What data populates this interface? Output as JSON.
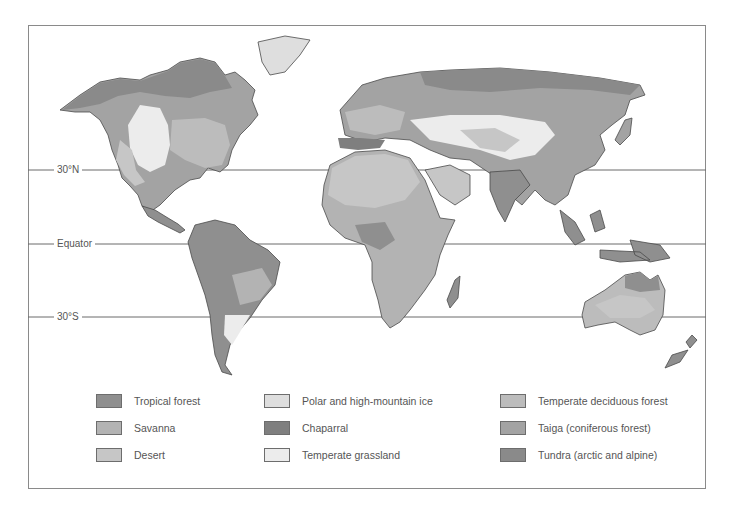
{
  "map": {
    "title": "World biomes",
    "latitude_lines": [
      {
        "label": "30°N",
        "y": 170
      },
      {
        "label": "Equator",
        "y": 244
      },
      {
        "label": "30°S",
        "y": 317
      }
    ],
    "colors": {
      "tropical_forest": "#8f8f8f",
      "savanna": "#b3b3b3",
      "desert": "#c6c6c6",
      "polar_ice": "#dedede",
      "chaparral": "#7f7f7f",
      "temperate_grassland": "#ececec",
      "temperate_deciduous_forest": "#bcbcbc",
      "taiga": "#a3a3a3",
      "tundra": "#8a8a8a"
    }
  },
  "legend": {
    "items": [
      {
        "label": "Tropical forest",
        "color": "#8f8f8f"
      },
      {
        "label": "Savanna",
        "color": "#b3b3b3"
      },
      {
        "label": "Desert",
        "color": "#c6c6c6"
      },
      {
        "label": "Polar and high-mountain ice",
        "color": "#dedede"
      },
      {
        "label": "Chaparral",
        "color": "#7f7f7f"
      },
      {
        "label": "Temperate grassland",
        "color": "#ececec"
      },
      {
        "label": "Temperate deciduous forest",
        "color": "#bcbcbc"
      },
      {
        "label": "Taiga (coniferous forest)",
        "color": "#a3a3a3"
      },
      {
        "label": "Tundra (arctic and alpine)",
        "color": "#8a8a8a"
      }
    ]
  }
}
